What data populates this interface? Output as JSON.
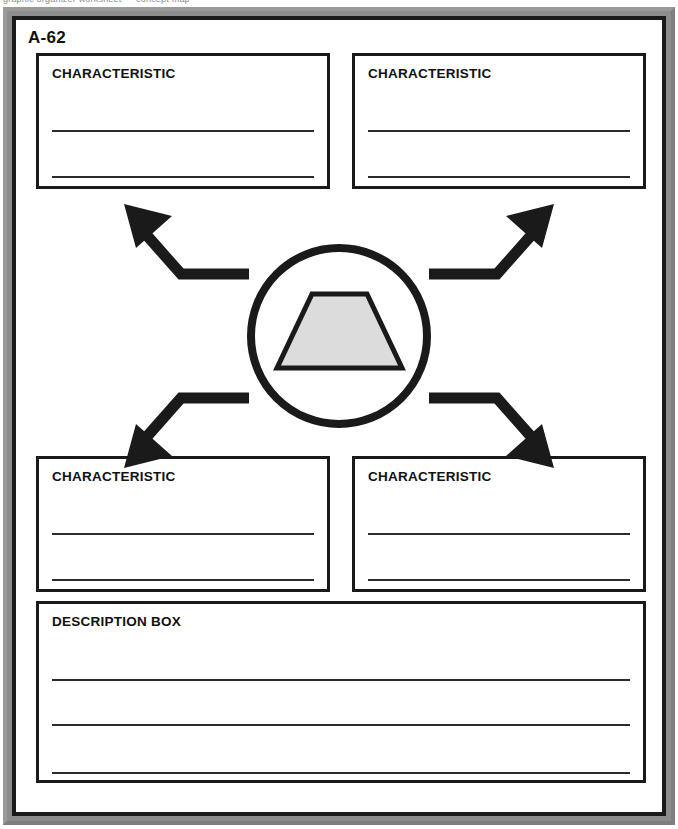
{
  "worksheet": {
    "code_label": "A-62",
    "scan_artifact_text": "graphic organizer worksheet — concept map",
    "frame_color": "#8d8d8d",
    "border_color": "#1a1a1a",
    "page_color": "#ffffff"
  },
  "center": {
    "shape_name": "trapezoid",
    "shape_fill": "#dcdcdc",
    "shape_stroke": "#1a1a1a",
    "circle_stroke": "#1a1a1a"
  },
  "arrows": [
    {
      "name": "arrow-center-to-top-left",
      "direction": "up-left"
    },
    {
      "name": "arrow-center-to-top-right",
      "direction": "up-right"
    },
    {
      "name": "arrow-center-to-bottom-left",
      "direction": "down-left"
    },
    {
      "name": "arrow-center-to-bottom-right",
      "direction": "down-right"
    }
  ],
  "boxes": {
    "top_left": {
      "title": "CHARACTERISTIC",
      "lines": 2
    },
    "top_right": {
      "title": "CHARACTERISTIC",
      "lines": 2
    },
    "bottom_left": {
      "title": "CHARACTERISTIC",
      "lines": 2
    },
    "bottom_right": {
      "title": "CHARACTERISTIC",
      "lines": 2
    },
    "description": {
      "title": "DESCRIPTION BOX",
      "lines": 3
    }
  }
}
